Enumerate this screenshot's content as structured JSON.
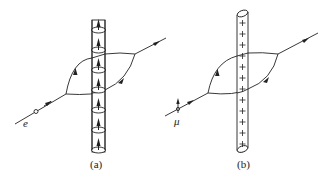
{
  "figure": {
    "panels": [
      {
        "id": "a",
        "caption": "(a)",
        "particle_label": "e",
        "tube_description": "current-carrying solenoid / tube with upward arrows inside ring loops",
        "ring_count": 7,
        "internal_arrow": "up"
      },
      {
        "id": "b",
        "caption": "(b)",
        "particle_label": "μ",
        "tube_description": "charged rod with plus signs",
        "plus_count": 12,
        "charge_symbol": "+"
      }
    ],
    "colors": {
      "stroke": "#222222",
      "background": "#ffffff"
    }
  }
}
